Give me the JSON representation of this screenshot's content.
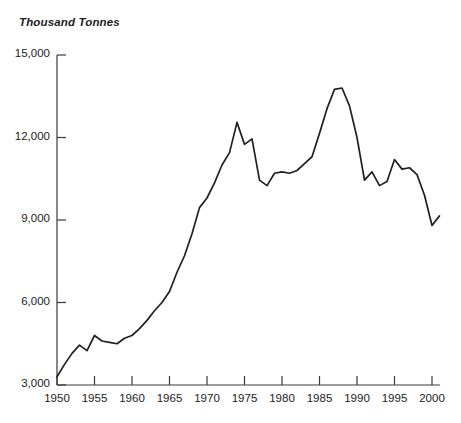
{
  "chart_data": {
    "type": "line",
    "title": "Thousand Tonnes",
    "xlabel": "",
    "ylabel": "Thousand Tonnes",
    "ylim": [
      3000,
      15000
    ],
    "xlim": [
      1950,
      2001
    ],
    "grid": false,
    "legend": null,
    "y_ticks": [
      3000,
      6000,
      9000,
      12000,
      15000
    ],
    "y_tick_labels": [
      "3,000",
      "6,000",
      "9,000",
      "12,000",
      "15,000"
    ],
    "x_ticks": [
      1950,
      1955,
      1960,
      1965,
      1970,
      1975,
      1980,
      1985,
      1990,
      1995,
      2000
    ],
    "x_tick_labels": [
      "1950",
      "1955",
      "1960",
      "1965",
      "1970",
      "1975",
      "1980",
      "1985",
      "1990",
      "1995",
      "2000"
    ],
    "line_color": "#231f20",
    "x": [
      1950,
      1951,
      1952,
      1953,
      1954,
      1955,
      1956,
      1957,
      1958,
      1959,
      1960,
      1961,
      1962,
      1963,
      1964,
      1965,
      1966,
      1967,
      1968,
      1969,
      1970,
      1971,
      1972,
      1973,
      1974,
      1975,
      1976,
      1977,
      1978,
      1979,
      1980,
      1981,
      1982,
      1983,
      1984,
      1985,
      1986,
      1987,
      1988,
      1989,
      1990,
      1991,
      1992,
      1993,
      1994,
      1995,
      1996,
      1997,
      1998,
      1999,
      2000,
      2001
    ],
    "values": [
      3300,
      3750,
      4150,
      4450,
      4250,
      4800,
      4600,
      4550,
      4500,
      4700,
      4800,
      5050,
      5350,
      5700,
      6000,
      6400,
      7100,
      7700,
      8500,
      9450,
      9800,
      10350,
      11000,
      11450,
      12550,
      11750,
      11950,
      10450,
      10250,
      10700,
      10750,
      10700,
      10800,
      11050,
      11300,
      12150,
      13050,
      13750,
      13800,
      13150,
      12000,
      10450,
      10750,
      10250,
      10400,
      11200,
      10850,
      10900,
      10650,
      9900,
      8800,
      9150
    ],
    "series_name": "Production"
  },
  "figure": {
    "axis_title": "Thousand Tonnes"
  }
}
